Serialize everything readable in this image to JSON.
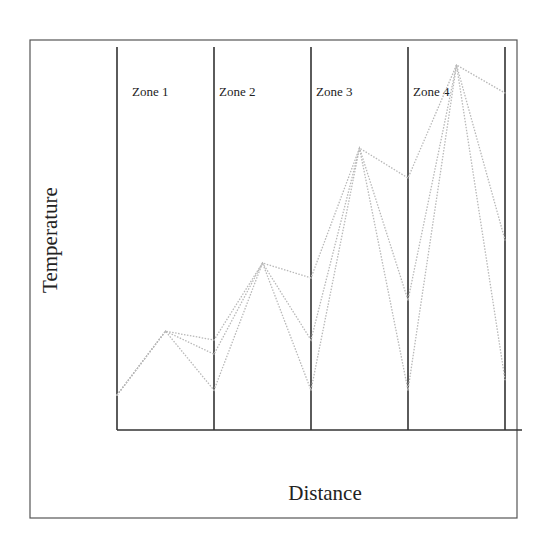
{
  "chart_data": {
    "type": "line",
    "title": "",
    "xlabel": "Distance",
    "ylabel": "Temperature",
    "xlim": [
      0,
      4
    ],
    "ylim": [
      0,
      100
    ],
    "grid": false,
    "legend": "none",
    "zones": [
      {
        "label": "Zone 1",
        "start": 0,
        "end": 1
      },
      {
        "label": "Zone 2",
        "start": 1,
        "end": 2
      },
      {
        "label": "Zone 3",
        "start": 2,
        "end": 3
      },
      {
        "label": "Zone 4",
        "start": 3,
        "end": 4
      }
    ],
    "x": [
      0,
      0.5,
      1,
      1.5,
      2,
      2.5,
      3,
      3.5,
      4
    ],
    "series": [
      {
        "name": "profile-upper",
        "values": [
          9.1,
          25.8,
          23.5,
          43.6,
          39.7,
          73.6,
          65.8,
          95.3,
          88.0
        ]
      },
      {
        "name": "profile-middle",
        "values": [
          9.1,
          25.8,
          19.8,
          43.6,
          23.5,
          73.6,
          33.9,
          95.3,
          49.6
        ]
      },
      {
        "name": "profile-lower",
        "values": [
          9.1,
          25.8,
          10.4,
          43.6,
          10.4,
          73.6,
          10.4,
          95.3,
          13.1
        ]
      }
    ],
    "line_color": "#b8b8b8",
    "line_style": "dotted"
  }
}
